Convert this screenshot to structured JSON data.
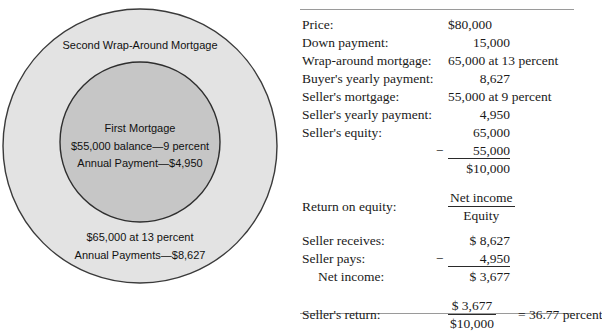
{
  "diagram": {
    "outer_label": "Second Wrap-Around Mortgage",
    "inner_lines": [
      "First Mortgage",
      "$55,000 balance—9 percent",
      "Annual Payment—$4,950"
    ],
    "outer_bottom_lines": [
      "$65,000 at 13 percent",
      "Annual Payments—$8,627"
    ],
    "colors": {
      "outer_fill": "#e3e3e3",
      "inner_fill": "#c6c6c6",
      "stroke": "#3a3a3a"
    }
  },
  "table": {
    "rows": [
      {
        "label": "Price:",
        "value": "$80,000"
      },
      {
        "label": "Down payment:",
        "value": "15,000"
      },
      {
        "label": "Wrap-around mortgage:",
        "value": "65,000 at 13 percent"
      },
      {
        "label": "Buyer's yearly payment:",
        "value": "8,627"
      },
      {
        "label": "Seller's mortgage:",
        "value": "55,000 at 9 percent"
      },
      {
        "label": "Seller's yearly payment:",
        "value": "4,950"
      },
      {
        "label": "Seller's equity:",
        "value": "65,000"
      }
    ],
    "equity_subtrahend": "55,000",
    "equity_minus_sign": "−",
    "equity_total": "$10,000",
    "return_on_equity": {
      "label": "Return on equity:",
      "numerator": "Net income",
      "denominator": "Equity"
    },
    "income_rows": [
      {
        "label": "Seller receives:",
        "value": "$ 8,627",
        "minus": ""
      },
      {
        "label": "Seller pays:",
        "value": "4,950",
        "minus": "−"
      },
      {
        "label": "Net income:",
        "value": "$ 3,677",
        "minus": ""
      }
    ],
    "sellers_return": {
      "label": "Seller's return:",
      "numerator": "$ 3,677",
      "denominator": "$10,000",
      "result": "= 36.77 percent"
    }
  }
}
